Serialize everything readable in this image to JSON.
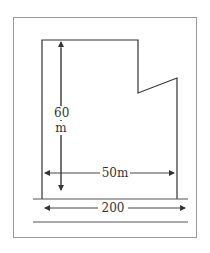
{
  "diagram": {
    "type": "land-plot-dimension-drawing",
    "labels": {
      "height_value": "60",
      "height_unit": "m",
      "width_inner": "50m",
      "width_outer": "200"
    },
    "colors": {
      "frame": "#999999",
      "shape": "#333333",
      "arrow": "#444444"
    }
  }
}
